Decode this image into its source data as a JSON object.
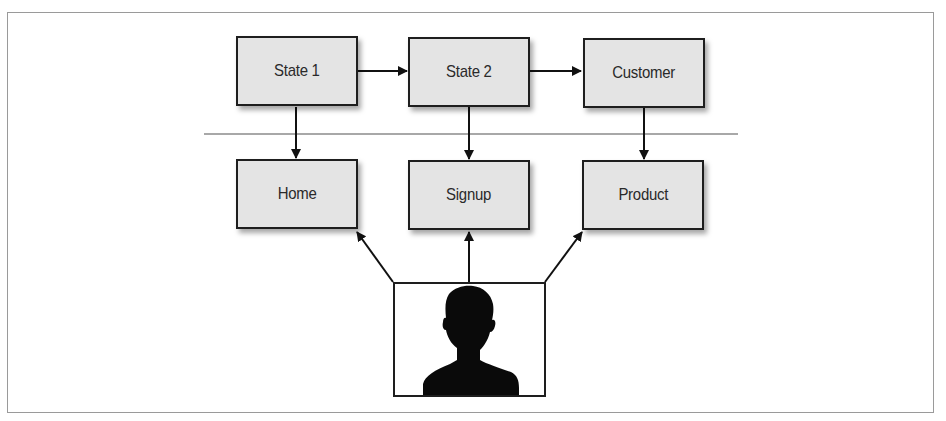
{
  "diagram": {
    "type": "flow-diagram",
    "top_row": [
      {
        "id": "state1",
        "label": "State 1"
      },
      {
        "id": "state2",
        "label": "State 2"
      },
      {
        "id": "customer",
        "label": "Customer"
      }
    ],
    "bottom_row": [
      {
        "id": "home",
        "label": "Home"
      },
      {
        "id": "signup",
        "label": "Signup"
      },
      {
        "id": "product",
        "label": "Product"
      }
    ],
    "actor": {
      "id": "user",
      "icon": "person-silhouette-icon"
    },
    "edges": [
      {
        "from": "state1",
        "to": "state2"
      },
      {
        "from": "state2",
        "to": "customer"
      },
      {
        "from": "state1",
        "to": "home"
      },
      {
        "from": "state2",
        "to": "signup"
      },
      {
        "from": "customer",
        "to": "product"
      },
      {
        "from": "user",
        "to": "home"
      },
      {
        "from": "user",
        "to": "signup"
      },
      {
        "from": "user",
        "to": "product"
      }
    ],
    "separator": "horizontal divider between top and bottom rows",
    "colors": {
      "node_fill": "#e4e4e4",
      "node_border": "#1e1e1e",
      "separator": "#a0a0a0",
      "frame": "#9a9a9a"
    }
  }
}
